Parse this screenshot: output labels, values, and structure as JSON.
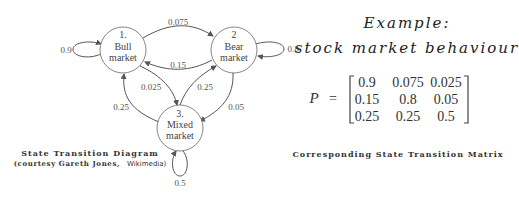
{
  "diagram": {
    "title": "State Transition Diagram",
    "credit_prefix": "(courtesy Gareth Jones,",
    "credit_source": "Wikimedia)",
    "nodes": [
      {
        "id": 1,
        "number": "1.",
        "line1": "Bull",
        "line2": "market"
      },
      {
        "id": 2,
        "number": "2",
        "line1": "Bear",
        "line2": "market"
      },
      {
        "id": 3,
        "number": "3.",
        "line1": "Mixed",
        "line2": "market"
      }
    ],
    "edges": [
      {
        "from": 1,
        "to": 1,
        "label": "0.9"
      },
      {
        "from": 1,
        "to": 2,
        "label": "0.075"
      },
      {
        "from": 2,
        "to": 1,
        "label": "0.15"
      },
      {
        "from": 1,
        "to": 3,
        "label": "0.025"
      },
      {
        "from": 3,
        "to": 1,
        "label": "0.25"
      },
      {
        "from": 3,
        "to": 2,
        "label": "0.25"
      },
      {
        "from": 2,
        "to": 3,
        "label": "0.05"
      },
      {
        "from": 2,
        "to": 2,
        "label": "0.8"
      },
      {
        "from": 3,
        "to": 3,
        "label": "0.5"
      }
    ]
  },
  "example": {
    "line1": "Example:",
    "line2": "stock market behaviour"
  },
  "matrix": {
    "symbol": "P",
    "equals": "=",
    "rows": [
      [
        "0.9",
        "0.075",
        "0.025"
      ],
      [
        "0.15",
        "0.8",
        "0.05"
      ],
      [
        "0.25",
        "0.25",
        "0.5"
      ]
    ],
    "caption": "Corresponding State Transition Matrix"
  },
  "colors": {
    "stroke": "#555555",
    "node_fill": "#ffffff",
    "text": "#333333",
    "background": "#ffffff"
  }
}
